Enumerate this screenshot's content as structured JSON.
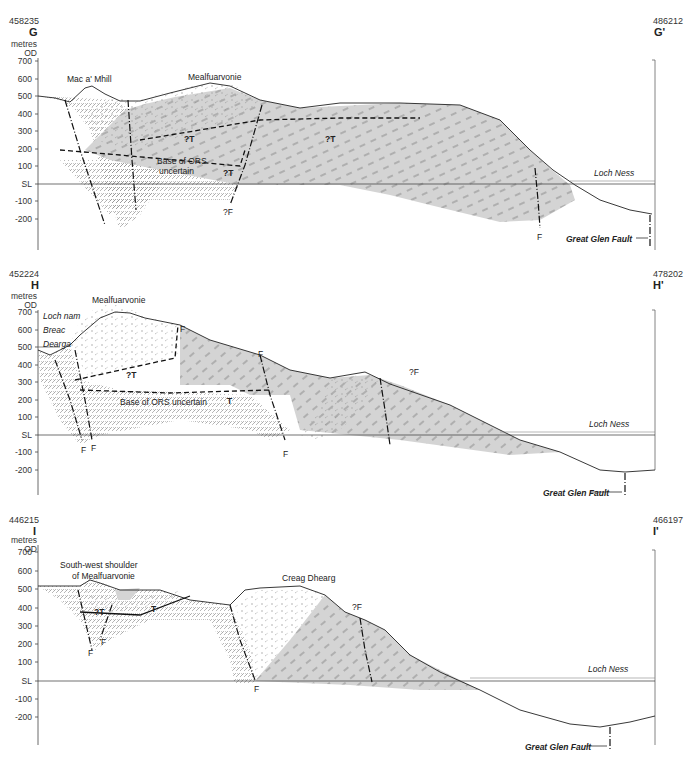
{
  "header": {
    "running_title_partial": "(cropped running header)"
  },
  "sections": [
    {
      "id": "G",
      "left_coord": "458235",
      "left_letter": "G",
      "right_coord": "486212",
      "right_letter": "G'",
      "unit_line1": "metres",
      "unit_line2": "OD",
      "y_ticks": [
        "700",
        "600",
        "500",
        "400",
        "300",
        "200",
        "100",
        "SL",
        "-100",
        "-200"
      ],
      "place_labels": [
        "Mac a' Mhill",
        "Mealfuarvonie"
      ],
      "annotations": [
        "?T",
        "?T",
        "Base of ORS",
        "uncertain",
        "?T",
        "?F",
        "F"
      ],
      "water_label": "Loch Ness",
      "fault_label": "Great Glen Fault"
    },
    {
      "id": "H",
      "left_coord": "452224",
      "left_letter": "H",
      "right_coord": "478202",
      "right_letter": "H'",
      "unit_line1": "metres",
      "unit_line2": "OD",
      "y_ticks": [
        "700",
        "600",
        "500",
        "400",
        "300",
        "200",
        "100",
        "SL",
        "-100",
        "-200"
      ],
      "place_labels": [
        "Mealfuarvonie"
      ],
      "lake_label": [
        "Loch nam",
        "Breac",
        "Dearga"
      ],
      "annotations": [
        "F",
        "F",
        "?T",
        "Base of ORS uncertain",
        "T",
        "?F",
        "F",
        "F",
        "F"
      ],
      "water_label": "Loch Ness",
      "fault_label": "Great Glen Fault"
    },
    {
      "id": "I",
      "left_coord": "446215",
      "left_letter": "I",
      "right_coord": "466197",
      "right_letter": "I'",
      "unit_line1": "metres",
      "unit_line2": "OD",
      "y_ticks": [
        "700",
        "600",
        "500",
        "400",
        "300",
        "200",
        "100",
        "SL",
        "-100",
        "-200"
      ],
      "place_labels": [
        "South-west shoulder",
        "of Mealfuarvonie",
        "Creag Dhearg"
      ],
      "annotations": [
        "?T",
        "T",
        "F",
        "F",
        "?F",
        "F"
      ],
      "water_label": "Loch Ness",
      "fault_label": "Great Glen Fault"
    }
  ],
  "colors": {
    "shade": "#d4d4d4",
    "line": "#222222",
    "hatch": "#777777",
    "water_line": "#888888"
  }
}
